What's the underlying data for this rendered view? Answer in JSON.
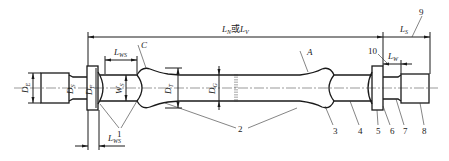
{
  "diagram": {
    "type": "engineering-drawing",
    "dimensions": {
      "overall_length": "L_N或L_V",
      "overall_length_parts": [
        "L",
        "N",
        "或",
        "L",
        "V"
      ],
      "grip_section_left": "L_WS",
      "grip_section_left_parts": [
        "L",
        "WS"
      ],
      "flange_thickness": "L_WS",
      "flange_thickness_parts": [
        "L",
        "WS"
      ],
      "end_length": "L_S",
      "end_length_parts": [
        "L",
        "S"
      ],
      "groove_length": "L_W",
      "groove_length_parts": [
        "L",
        "W"
      ],
      "diameter_end": "D_E",
      "diameter_end_parts": [
        "D",
        "E"
      ],
      "diameter_neck": "D_S",
      "diameter_neck_parts": [
        "D",
        "S"
      ],
      "diameter_flange": "D_F",
      "diameter_flange_parts": [
        "D",
        "F"
      ],
      "width_section": "W_S",
      "width_section_parts": [
        "W",
        "S"
      ],
      "diameter_transition": "D_T",
      "diameter_transition_parts": [
        "D",
        "T"
      ],
      "diameter_gauge": "D_G",
      "diameter_gauge_parts": [
        "D",
        "G"
      ]
    },
    "detail_labels": {
      "C": "C",
      "A": "A"
    },
    "callouts": [
      "1",
      "2",
      "3",
      "4",
      "5",
      "6",
      "7",
      "8",
      "9",
      "10"
    ]
  }
}
